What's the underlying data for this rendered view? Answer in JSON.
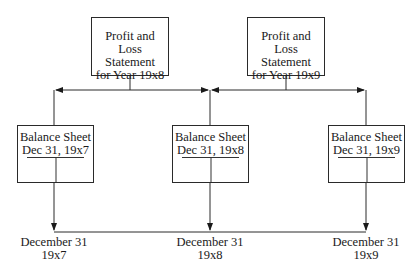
{
  "diagram": {
    "income_statements": [
      {
        "line1": "Profit and Loss",
        "line2": "Statement",
        "line3": "for Year 19x8"
      },
      {
        "line1": "Profit and Loss",
        "line2": "Statement",
        "line3": "for Year 19x9"
      }
    ],
    "balance_sheets": [
      {
        "title": "Balance Sheet",
        "date": "Dec 31, 19x7"
      },
      {
        "title": "Balance Sheet",
        "date": "Dec 31, 19x8"
      },
      {
        "title": "Balance Sheet",
        "date": "Dec 31, 19x9"
      }
    ],
    "timeline": [
      {
        "line1": "December 31",
        "line2": "19x7"
      },
      {
        "line1": "December 31",
        "line2": "19x8"
      },
      {
        "line1": "December 31",
        "line2": "19x9"
      }
    ],
    "colors": {
      "line": "#2a2a2a",
      "background": "#ffffff"
    }
  }
}
